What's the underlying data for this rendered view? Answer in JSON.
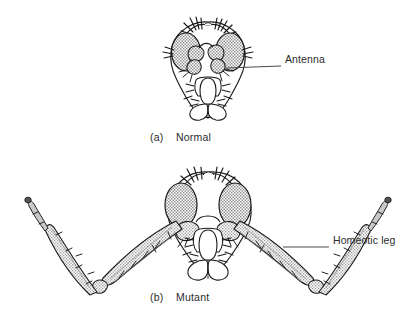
{
  "figure": {
    "title_visible": false,
    "background_color": "#ffffff",
    "ink_color": "#1a1a1a",
    "shade_color": "#b9b9b9",
    "shade_color_dark": "#9a9a9a",
    "label_color": "#2b2b2b",
    "leader_color": "#4a4a4a"
  },
  "panels": [
    {
      "id": "normal",
      "index_label": "(a)",
      "name_label": "Normal",
      "caption_x": 150,
      "caption_y": 131,
      "description": "Frontal view of a normal Drosophila head with paired stippled compound eyes, a pair of segmented antennae between the eyes, bristles on the vertex, and the proboscis with labellum below.",
      "callouts": [
        {
          "id": "antenna",
          "label": "Antenna",
          "label_x": 285,
          "label_y": 60,
          "leader_from_x": 226,
          "leader_from_y": 68,
          "leader_to_x": 281,
          "leader_to_y": 66
        }
      ]
    },
    {
      "id": "mutant",
      "index_label": "(b)",
      "name_label": "Mutant",
      "caption_x": 150,
      "caption_y": 291,
      "description": "Frontal view of an Antennapedia homeotic mutant head. The antennae are replaced by a pair of fully formed legs that extend outward and upward in a wide V, each leg bearing bristles and tapering to a clawed tarsal tip.",
      "callouts": [
        {
          "id": "homeotic-leg",
          "label": "Homeotic leg",
          "label_x": 333,
          "label_y": 241,
          "leader_from_x": 283,
          "leader_from_y": 247,
          "leader_to_x": 329,
          "leader_to_y": 247
        }
      ]
    }
  ]
}
